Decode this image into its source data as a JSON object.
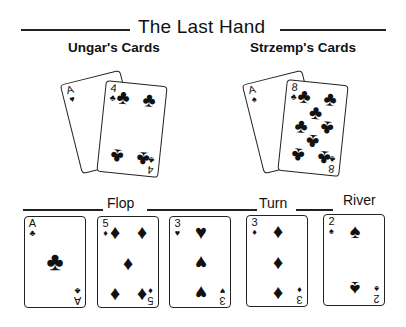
{
  "title": "The Last Hand",
  "players": [
    {
      "name": "Ungar's Cards",
      "cards": [
        {
          "rank": "A",
          "suit": "♥",
          "suit_name": "hearts"
        },
        {
          "rank": "4",
          "suit": "♣",
          "suit_name": "clubs"
        }
      ]
    },
    {
      "name": "Strzemp's Cards",
      "cards": [
        {
          "rank": "A",
          "suit": "♠",
          "suit_name": "spades"
        },
        {
          "rank": "8",
          "suit": "♣",
          "suit_name": "clubs"
        }
      ]
    }
  ],
  "board": {
    "flop_label": "Flop",
    "turn_label": "Turn",
    "river_label": "River",
    "cards": [
      {
        "rank": "A",
        "suit": "♣",
        "suit_name": "clubs"
      },
      {
        "rank": "5",
        "suit": "♦",
        "suit_name": "diamonds"
      },
      {
        "rank": "3",
        "suit": "♥",
        "suit_name": "hearts"
      },
      {
        "rank": "3",
        "suit": "♦",
        "suit_name": "diamonds"
      },
      {
        "rank": "2",
        "suit": "♠",
        "suit_name": "spades"
      }
    ]
  }
}
